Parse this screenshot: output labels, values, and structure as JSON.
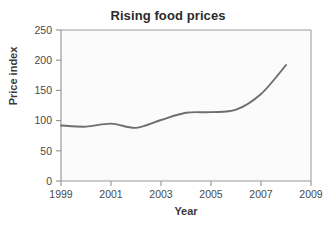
{
  "chart_data": {
    "type": "line",
    "title": "Rising food prices",
    "xlabel": "Year",
    "ylabel": "Price index",
    "x": [
      1999,
      2000,
      2001,
      2002,
      2003,
      2004,
      2005,
      2006,
      2007,
      2008
    ],
    "values": [
      92,
      90,
      95,
      88,
      101,
      113,
      114,
      118,
      144,
      192
    ],
    "series": [
      {
        "name": "Price index",
        "values": [
          92,
          90,
          95,
          88,
          101,
          113,
          114,
          118,
          144,
          192
        ]
      }
    ],
    "xlim": [
      1999,
      2009
    ],
    "ylim": [
      0,
      250
    ],
    "xticks": [
      1999,
      2001,
      2003,
      2005,
      2007,
      2009
    ],
    "xtick_labels": [
      "1999",
      "2001",
      "2003",
      "2005",
      "2007",
      "2009"
    ],
    "yticks": [
      0,
      50,
      100,
      150,
      200,
      250
    ],
    "ytick_labels": [
      "0",
      "50",
      "100",
      "150",
      "200",
      "250"
    ],
    "grid": false,
    "legend": false,
    "legend_position": "none",
    "line_color": "#6e6e6e",
    "plot_background": "#fbfbfb",
    "frame_color": "#9a9a9a",
    "text_color": "#3a3a3a",
    "title_color": "#2b2b2b"
  }
}
